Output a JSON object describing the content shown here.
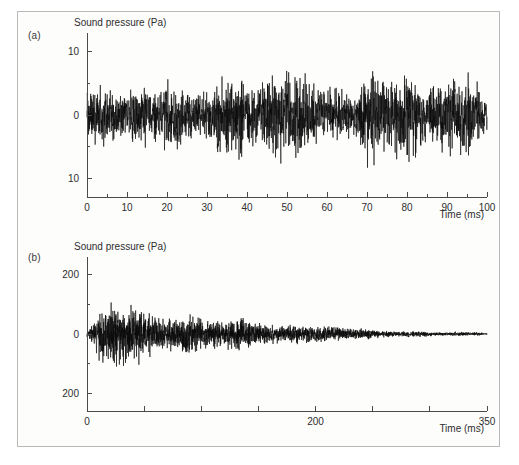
{
  "figure": {
    "background_color": "#fdfdfc",
    "border_color": "#b9b9b9",
    "trace_color": "#0a0a0a",
    "axis_color": "#4a4a4a"
  },
  "panels": [
    {
      "letter": "(a)",
      "ylabel": "Sound pressure (Pa)",
      "xlabel": "Time (ms)"
    },
    {
      "letter": "(b)",
      "ylabel": "Sound pressure (Pa)",
      "xlabel": "Time (ms)"
    }
  ],
  "chart_data": [
    {
      "type": "line",
      "panel": "(a)",
      "title": "",
      "xlabel": "Time (ms)",
      "ylabel": "Sound pressure (Pa)",
      "xlim": [
        0,
        100
      ],
      "ylim": [
        -13,
        13
      ],
      "grid": false,
      "legend": null,
      "xticks": [
        0,
        10,
        20,
        30,
        40,
        50,
        60,
        70,
        80,
        90,
        100
      ],
      "xtick_labels": [
        "0",
        "10",
        "20",
        "30",
        "40",
        "50",
        "60",
        "70",
        "80",
        "90",
        "100"
      ],
      "xminor_step": 5,
      "yticks": [
        -10,
        0,
        10
      ],
      "ytick_labels": [
        "10",
        "0",
        "10"
      ],
      "yminor_step": 5,
      "description": "Broadband noise-like sound pressure signal, roughly stationary with slowly increasing amplitude toward the end of the record",
      "envelope": {
        "x": [
          0,
          5,
          10,
          15,
          20,
          25,
          30,
          35,
          40,
          45,
          50,
          55,
          60,
          65,
          70,
          75,
          80,
          85,
          90,
          95,
          100
        ],
        "upper": [
          6.0,
          9.5,
          6.5,
          11.5,
          7.0,
          7.5,
          7.0,
          8.0,
          7.5,
          8.5,
          9.0,
          11.0,
          9.0,
          8.5,
          10.5,
          8.5,
          9.0,
          8.0,
          9.5,
          7.5,
          8.0
        ],
        "lower": [
          -6.0,
          -10.5,
          -6.5,
          -11.5,
          -7.5,
          -8.5,
          -7.5,
          -12.0,
          -8.0,
          -11.0,
          -9.0,
          -9.5,
          -8.5,
          -8.0,
          -10.0,
          -8.5,
          -10.5,
          -9.5,
          -10.0,
          -8.0,
          -7.0
        ]
      },
      "series": [
        {
          "name": "sound pressure",
          "seed": 20341,
          "samples": 2400,
          "base_amplitude": 4.2,
          "growth": 0.42
        }
      ]
    },
    {
      "type": "line",
      "panel": "(b)",
      "title": "",
      "xlabel": "Time (ms)",
      "ylabel": "Sound pressure (Pa)",
      "xlim": [
        0,
        350
      ],
      "ylim": [
        -260,
        260
      ],
      "grid": false,
      "legend": null,
      "xticks": [
        0,
        50,
        100,
        150,
        200,
        250,
        300,
        350
      ],
      "xtick_labels": [
        "0",
        "",
        "",
        "",
        "200",
        "",
        "",
        "350"
      ],
      "xminor_step": 50,
      "yticks": [
        -200,
        0,
        200
      ],
      "ytick_labels": [
        "200",
        "0",
        "200"
      ],
      "yminor_step": 100,
      "description": "Room impulse response: large early amplitude decaying exponentially toward near zero at 350 ms",
      "envelope": {
        "x": [
          0,
          10,
          20,
          30,
          40,
          50,
          60,
          70,
          80,
          100,
          120,
          140,
          160,
          180,
          200,
          230,
          260,
          290,
          320,
          350
        ],
        "upper": [
          20,
          130,
          175,
          150,
          185,
          115,
          100,
          95,
          90,
          80,
          95,
          70,
          55,
          45,
          40,
          30,
          22,
          15,
          10,
          6
        ],
        "lower": [
          -20,
          -140,
          -195,
          -230,
          -175,
          -135,
          -110,
          -100,
          -95,
          -85,
          -90,
          -72,
          -58,
          -46,
          -40,
          -30,
          -22,
          -15,
          -10,
          -6
        ]
      },
      "series": [
        {
          "name": "sound pressure",
          "seed": 77713,
          "samples": 3200,
          "peak_amplitude": 150,
          "attack_ms": 12,
          "decay_constant_ms": 78
        }
      ]
    }
  ]
}
